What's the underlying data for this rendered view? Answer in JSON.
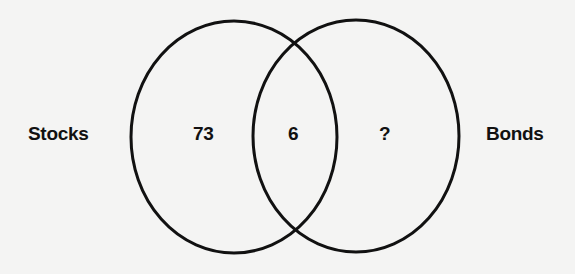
{
  "diagram": {
    "type": "venn",
    "sets": [
      {
        "name": "Stocks",
        "only_count": "73"
      },
      {
        "name": "Bonds",
        "only_count": "?"
      }
    ],
    "intersection_count": "6",
    "colors": {
      "background": "#f4f4f3",
      "stroke": "#111111",
      "text": "#111111"
    }
  },
  "labels": {
    "left_set": "Stocks",
    "right_set": "Bonds",
    "left_only": "73",
    "both": "6",
    "right_only": "?"
  }
}
